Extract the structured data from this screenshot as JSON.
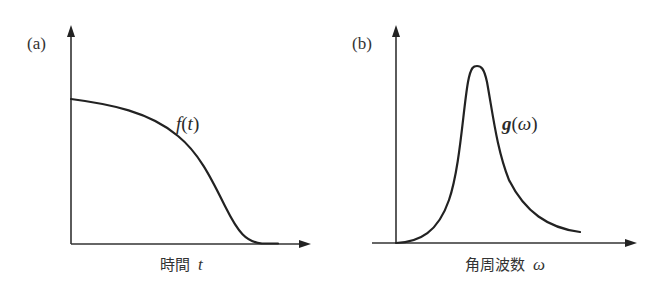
{
  "figure": {
    "panel_a": {
      "label": "(a)",
      "function_label": {
        "name": "f",
        "open": "(",
        "var": "t",
        "close": ")"
      },
      "xaxis_label": {
        "text": "時間",
        "var": "t"
      },
      "description": "f(t) starts at a positive value, decreases slowly then steeply, and flattens to zero"
    },
    "panel_b": {
      "label": "(b)",
      "function_label": {
        "name": "g",
        "open": "(",
        "var": "ω",
        "close": ")"
      },
      "xaxis_label": {
        "text": "角周波数",
        "var": "ω"
      },
      "description": "g(ω) is a sharp peak (Lorentzian-like) rising from zero, peaking, then decaying with a long tail"
    },
    "colors": {
      "line": "#222222",
      "axis": "#333333",
      "background": "#ffffff"
    }
  }
}
